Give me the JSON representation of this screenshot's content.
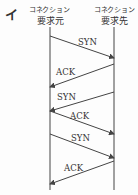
{
  "figure": {
    "label": "イ",
    "participants": [
      {
        "line1": "コネクション",
        "line2": "要求元",
        "x": 50
      },
      {
        "line1": "コネクション",
        "line2": "要求先",
        "x": 114
      }
    ],
    "messages": [
      {
        "label": "SYN",
        "from": 0,
        "to": 1,
        "y1": 36,
        "y2": 58,
        "lx": 78,
        "ly": 37
      },
      {
        "label": "ACK",
        "from": 1,
        "to": 0,
        "y1": 64,
        "y2": 87,
        "lx": 56,
        "ly": 67
      },
      {
        "label": "SYN",
        "from": 1,
        "to": 0,
        "y1": 92,
        "y2": 111,
        "lx": 57,
        "ly": 92
      },
      {
        "label": "ACK",
        "from": 0,
        "to": 1,
        "y1": 111,
        "y2": 134,
        "lx": 70,
        "ly": 111
      },
      {
        "label": "SYN",
        "from": 0,
        "to": 1,
        "y1": 134,
        "y2": 158,
        "lx": 71,
        "ly": 133
      },
      {
        "label": "ACK",
        "from": 1,
        "to": 0,
        "y1": 161,
        "y2": 184,
        "lx": 64,
        "ly": 163
      }
    ],
    "line_color": "#444444"
  }
}
